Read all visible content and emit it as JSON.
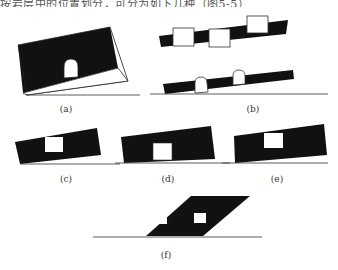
{
  "header": {
    "partial_text": "按岩层中的位置划分，可分为如下几种（图5-5）"
  },
  "figures": [
    {
      "id": "a",
      "label": "(a)",
      "description": "tilted block, black upper half, white lower half with arched tunnel opening"
    },
    {
      "id": "b",
      "label": "(b)",
      "description": "two tilted black strata bands; upper with three square openings, lower with two arched openings on ground line"
    },
    {
      "id": "c",
      "label": "(c)",
      "description": "tilted black stratum with square opening through middle"
    },
    {
      "id": "d",
      "label": "(d)",
      "description": "tilted black stratum with square opening at bottom"
    },
    {
      "id": "e",
      "label": "(e)",
      "description": "tilted black stratum with square opening at top"
    },
    {
      "id": "f",
      "label": "(f)",
      "description": "black parallelogram stratum on ground line with two square openings"
    }
  ],
  "colors": {
    "stratum": "#111111",
    "opening": "#ffffff",
    "ground_line": "#333333"
  }
}
